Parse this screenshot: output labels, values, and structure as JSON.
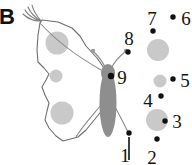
{
  "figure": {
    "panel_letter": "B",
    "description_type": "landmark-diagram",
    "colors": {
      "outline": "#6d6d6d",
      "spot_fill": "#c9c9c9",
      "body_fill": "#8e8e8e",
      "antenna": "#8a8a8a",
      "landmark_dot": "#111111",
      "label_text": "#141414",
      "background": "#ffffff"
    }
  },
  "landmarks": [
    {
      "id": "lm-1",
      "label": "1",
      "label_x": 130,
      "label_y": 160,
      "dot_x": 129,
      "dot_y": 133
    },
    {
      "id": "lm-2",
      "label": "2",
      "label_x": 152,
      "label_y": 163,
      "dot_x": 157,
      "dot_y": 139
    },
    {
      "id": "lm-3",
      "label": "3",
      "label_x": 175,
      "label_y": 127,
      "dot_x": 165,
      "dot_y": 121
    },
    {
      "id": "lm-4",
      "label": "4",
      "label_x": 147,
      "label_y": 107,
      "dot_x": 161,
      "dot_y": 96
    },
    {
      "id": "lm-5",
      "label": "5",
      "label_x": 182,
      "label_y": 86,
      "dot_x": 173,
      "dot_y": 79
    },
    {
      "id": "lm-6",
      "label": "6",
      "label_x": 183,
      "label_y": 23,
      "dot_x": 173,
      "dot_y": 17
    },
    {
      "id": "lm-7",
      "label": "7",
      "label_x": 145,
      "label_y": 24,
      "dot_x": 153,
      "dot_y": 31
    },
    {
      "id": "lm-8",
      "label": "8",
      "label_x": 124,
      "label_y": 43,
      "dot_x": 128,
      "dot_y": 52
    },
    {
      "id": "lm-9",
      "label": "9",
      "label_x": 118,
      "label_y": 83,
      "dot_x": 111,
      "dot_y": 76
    }
  ],
  "wing": {
    "outline_points": "40,23 42,20 58,22 72,28 80,36 86,46 97,58 104,68 110,76 113,84 112,94 104,108 95,119 86,130 78,137 63,141 56,136 49,128 45,120 47,111 49,103 45,95 42,87 46,80 49,74 44,68 38,62 37,50 38,35",
    "spots": [
      {
        "id": "wing-spot-upper",
        "cx": 57,
        "cy": 43,
        "r": 11.5
      },
      {
        "id": "wing-spot-middle",
        "cx": 56,
        "cy": 76,
        "r": 6.5
      },
      {
        "id": "wing-spot-lower",
        "cx": 62,
        "cy": 113,
        "r": 11.5
      }
    ]
  },
  "body": {
    "id": "moth-body",
    "cx": 108,
    "cy": 103,
    "rx": 8.5,
    "ry": 34
  },
  "head": {
    "id": "moth-head",
    "cx": 108,
    "cy": 73,
    "rx": 7,
    "ry": 9
  },
  "antennae": [
    {
      "id": "antenna-left",
      "path": "M 106,69 C 102,60 97,55 94,52",
      "tip_x": 93,
      "tip_y": 51,
      "tip_r": 2.2
    },
    {
      "id": "antenna-right",
      "path": "M 111,69 C 115,60 121,55 125,52",
      "tip_x": 126,
      "tip_y": 51,
      "tip_r": 2.2
    }
  ],
  "crest_arcs": [
    {
      "id": "crest-arc-1",
      "path": "M 41,21 C 36,15 33,10 32,5"
    },
    {
      "id": "crest-arc-2",
      "path": "M 41,21 C 34,17 30,12 28,7"
    },
    {
      "id": "crest-arc-3",
      "path": "M 41,21 C 33,19 28,15 25,10"
    },
    {
      "id": "crest-arc-4",
      "path": "M 41,21 C 33,21 27,18 23,14"
    }
  ],
  "reference_circles": [
    {
      "id": "ref-circle-7",
      "cx": 158,
      "cy": 50,
      "r": 11
    },
    {
      "id": "ref-circle-5",
      "cx": 160,
      "cy": 81,
      "r": 6.5
    },
    {
      "id": "ref-circle-3",
      "cx": 157,
      "cy": 120,
      "r": 11
    }
  ],
  "leader_lines": [
    {
      "id": "leader-line-1",
      "x1": 129,
      "y1": 137,
      "x2": 129,
      "y2": 160
    }
  ],
  "veins": [
    {
      "id": "vein-upper",
      "path": "M 40,23 C 58,43 80,58 101,70"
    },
    {
      "id": "vein-lower",
      "path": "M 101,105 C 92,116 82,127 76,137"
    },
    {
      "id": "vein-tail",
      "path": "M 114,105 C 120,116 125,126 129,134"
    }
  ]
}
